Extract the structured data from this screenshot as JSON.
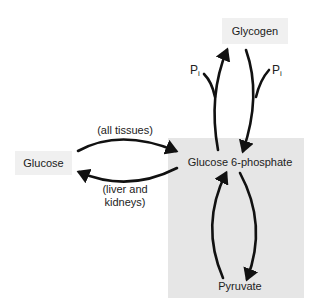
{
  "diagram": {
    "nodes": {
      "glycogen": "Glycogen",
      "glucose": "Glucose",
      "g6p": "Glucose 6-phosphate",
      "pyruvate": "Pyruvate"
    },
    "edge_labels": {
      "glucose_to_g6p": "(all tissues)",
      "g6p_to_glucose_line1": "(liver and",
      "g6p_to_glucose_line2": "kidneys)",
      "pi_left": "P",
      "pi_left_sub": "i",
      "pi_right": "P",
      "pi_right_sub": "i"
    },
    "colors": {
      "node_bg": "#f0f0f0",
      "region_bg": "#e6e6e6",
      "arrow": "#111111"
    }
  }
}
